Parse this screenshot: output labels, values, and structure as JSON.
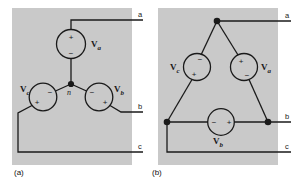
{
  "figure": {
    "background": "#ffffff",
    "panel_fill": "#c9c9c9",
    "line_color": "#1a1a1a",
    "panels": [
      {
        "id": "a",
        "caption": "(a)",
        "topology": "wye",
        "neutral_label": "n",
        "sources": [
          {
            "name": "Va",
            "label": "V",
            "subscript": "a",
            "plus": "top",
            "minus": "bottom"
          },
          {
            "name": "Vc",
            "label": "V",
            "subscript": "c",
            "plus": "bottom-left",
            "minus": "top-right"
          },
          {
            "name": "Vb",
            "label": "V",
            "subscript": "b",
            "plus": "bottom-right",
            "minus": "top-left"
          }
        ],
        "terminals": [
          {
            "name": "a",
            "label": "a"
          },
          {
            "name": "b",
            "label": "b"
          },
          {
            "name": "c",
            "label": "c"
          }
        ]
      },
      {
        "id": "b",
        "caption": "(b)",
        "topology": "delta",
        "sources": [
          {
            "name": "Vc",
            "label": "V",
            "subscript": "c",
            "plus": "bottom",
            "minus": "top"
          },
          {
            "name": "Va",
            "label": "V",
            "subscript": "a",
            "plus": "top",
            "minus": "bottom"
          },
          {
            "name": "Vb",
            "label": "V",
            "subscript": "b",
            "plus": "right",
            "minus": "left"
          }
        ],
        "terminals": [
          {
            "name": "a",
            "label": "a"
          },
          {
            "name": "b",
            "label": "b"
          },
          {
            "name": "c",
            "label": "c"
          }
        ]
      }
    ],
    "signs": {
      "plus": "+",
      "minus": "−"
    }
  }
}
